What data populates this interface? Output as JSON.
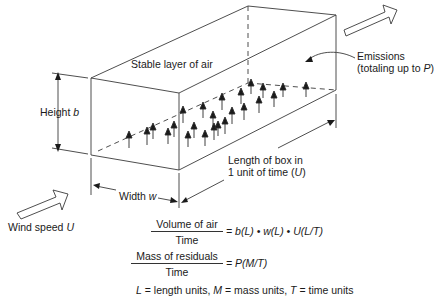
{
  "diagram": {
    "type": "box-model-air-pollution",
    "labels": {
      "top_face": "Stable layer of air",
      "height_prefix": "Height ",
      "height_var": "b",
      "width_prefix": "Width ",
      "width_var": "w",
      "length_line1": "Length of box in",
      "length_line2_prefix": "1 unit of time (",
      "length_line2_var": "U",
      "length_line2_suffix": ")",
      "emissions_line1": "Emissions",
      "emissions_line2_prefix": "(totaling up to ",
      "emissions_line2_var": "P",
      "emissions_line2_suffix": ")",
      "wind_prefix": "Wind speed ",
      "wind_var": "U"
    },
    "equations": [
      {
        "numerator": "Volume of air",
        "denominator": "Time",
        "rhs": "= b(L) • w(L) • U(L/T)"
      },
      {
        "numerator": "Mass of residuals",
        "denominator": "Time",
        "rhs": "= P(M/T)"
      }
    ],
    "units_note": {
      "L": "L",
      "L_text": " = length units, ",
      "M": "M",
      "M_text": " = mass units, ",
      "T": "T",
      "T_text": " = time units"
    },
    "colors": {
      "line": "#333333",
      "background": "#ffffff"
    }
  }
}
